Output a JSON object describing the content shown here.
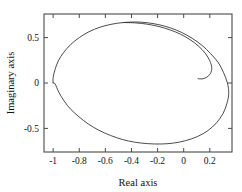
{
  "chart_data": {
    "type": "line",
    "title": "",
    "xlabel": "Real axis",
    "ylabel": "Imaginary axis",
    "xlim": [
      -1.07,
      0.37
    ],
    "ylim": [
      -0.76,
      0.76
    ],
    "xticks": [
      -1,
      -0.8,
      -0.6,
      -0.4,
      -0.2,
      0,
      0.2
    ],
    "xticklabels": [
      "-1",
      "-0.8",
      "-0.6",
      "-0.4",
      "-0.2",
      "0",
      "0.2"
    ],
    "yticks": [
      0.5,
      0,
      -0.5
    ],
    "yticklabels": [
      "0.5",
      "0",
      "-0.5"
    ],
    "grid": false,
    "legend": null,
    "line_color": "#2b2b2b",
    "frame_color": "#4a4a4a",
    "background": "#ffffff",
    "series": [
      {
        "name": "nyquist-locus",
        "points": [
          [
            -1.0,
            0.0
          ],
          [
            -1.0,
            0.06
          ],
          [
            -0.985,
            0.15
          ],
          [
            -0.96,
            0.245
          ],
          [
            -0.92,
            0.335
          ],
          [
            -0.865,
            0.425
          ],
          [
            -0.8,
            0.5
          ],
          [
            -0.725,
            0.565
          ],
          [
            -0.64,
            0.615
          ],
          [
            -0.55,
            0.648
          ],
          [
            -0.46,
            0.666
          ],
          [
            -0.37,
            0.672
          ],
          [
            -0.28,
            0.664
          ],
          [
            -0.19,
            0.642
          ],
          [
            -0.1,
            0.606
          ],
          [
            -0.015,
            0.556
          ],
          [
            0.065,
            0.492
          ],
          [
            0.14,
            0.415
          ],
          [
            0.205,
            0.325
          ],
          [
            0.265,
            0.225
          ],
          [
            0.305,
            0.115
          ],
          [
            0.335,
            0.0
          ],
          [
            0.345,
            -0.115
          ],
          [
            0.33,
            -0.23
          ],
          [
            0.3,
            -0.34
          ],
          [
            0.25,
            -0.44
          ],
          [
            0.185,
            -0.525
          ],
          [
            0.105,
            -0.59
          ],
          [
            0.015,
            -0.635
          ],
          [
            -0.08,
            -0.662
          ],
          [
            -0.175,
            -0.672
          ],
          [
            -0.275,
            -0.668
          ],
          [
            -0.375,
            -0.652
          ],
          [
            -0.47,
            -0.622
          ],
          [
            -0.56,
            -0.578
          ],
          [
            -0.65,
            -0.52
          ],
          [
            -0.73,
            -0.452
          ],
          [
            -0.8,
            -0.375
          ],
          [
            -0.865,
            -0.29
          ],
          [
            -0.915,
            -0.2
          ],
          [
            -0.955,
            -0.105
          ],
          [
            -0.985,
            -0.01
          ],
          [
            -1.0,
            0.0
          ]
        ]
      },
      {
        "name": "inner-spiral-arm",
        "points": [
          [
            -0.46,
            0.666
          ],
          [
            -0.37,
            0.662
          ],
          [
            -0.28,
            0.648
          ],
          [
            -0.19,
            0.622
          ],
          [
            -0.105,
            0.585
          ],
          [
            -0.025,
            0.538
          ],
          [
            0.048,
            0.478
          ],
          [
            0.112,
            0.408
          ],
          [
            0.165,
            0.328
          ],
          [
            0.2,
            0.245
          ],
          [
            0.215,
            0.168
          ],
          [
            0.205,
            0.105
          ],
          [
            0.175,
            0.062
          ],
          [
            0.14,
            0.045
          ],
          [
            0.11,
            0.048
          ]
        ]
      }
    ]
  },
  "axes": {
    "xlabel": "Real axis",
    "ylabel": "Imaginary axis"
  }
}
